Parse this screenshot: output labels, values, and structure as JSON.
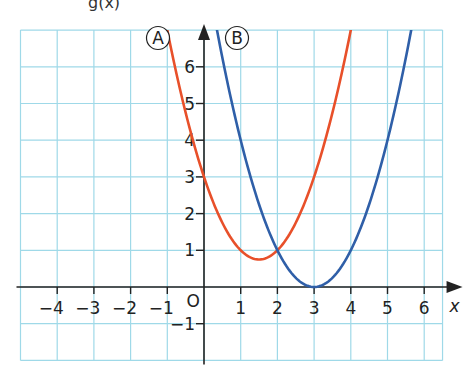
{
  "header_fragment": "g(x)",
  "chart_data": {
    "type": "line",
    "title": "",
    "xlabel": "x",
    "ylabel": "",
    "xlim": [
      -5,
      6.5
    ],
    "ylim": [
      -2,
      7
    ],
    "grid": true,
    "origin_label": "O",
    "x_ticks": [
      -4,
      -3,
      -2,
      -1,
      1,
      2,
      3,
      4,
      5,
      6
    ],
    "x_tick_labels": [
      "−4",
      "−3",
      "−2",
      "−1",
      "1",
      "2",
      "3",
      "4",
      "5",
      "6"
    ],
    "y_ticks": [
      -1,
      1,
      2,
      3,
      4,
      5,
      6
    ],
    "y_tick_labels": [
      "−1",
      "1",
      "2",
      "3",
      "4",
      "5",
      "6"
    ],
    "series": [
      {
        "name": "A",
        "label": "Ⓐ",
        "color": "#e8502a",
        "equation": "y = (x - 1.5)^2 + 0.75",
        "vertex": [
          1.5,
          0.75
        ],
        "x": [
          -1.0,
          -0.5,
          0,
          0.5,
          1,
          1.5,
          2,
          2.5,
          3,
          3.5,
          4.0
        ],
        "values": [
          7.0,
          4.75,
          3.0,
          1.75,
          1.0,
          0.75,
          1.0,
          1.75,
          3.0,
          4.75,
          7.0
        ]
      },
      {
        "name": "B",
        "label": "Ⓑ",
        "color": "#2f5fa8",
        "equation": "y = (x - 3)^2",
        "vertex": [
          3,
          0
        ],
        "x": [
          0.35,
          1,
          1.5,
          2,
          2.5,
          3,
          3.5,
          4,
          4.5,
          5,
          5.65
        ],
        "values": [
          7.0,
          4.0,
          2.25,
          1.0,
          0.25,
          0.0,
          0.25,
          1.0,
          2.25,
          4.0,
          7.0
        ]
      }
    ],
    "intersections": [
      [
        2,
        1
      ]
    ],
    "legend": "inline labels Ⓐ and Ⓑ near top of curves"
  },
  "colors": {
    "grid": "#9fd9e8",
    "axis": "#222222",
    "curve_a": "#e8502a",
    "curve_b": "#2f5fa8"
  }
}
